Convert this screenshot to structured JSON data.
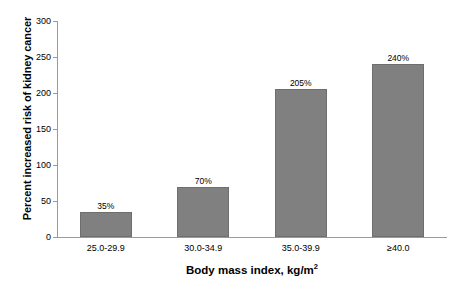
{
  "chart_data": {
    "type": "bar",
    "title": "",
    "subtitle": "",
    "xlabel": "Body mass index, kg/m",
    "xlabel_superscript": "2",
    "ylabel": "Percent increased risk of kidney cancer",
    "categories": [
      "25.0-29.9",
      "30.0-34.9",
      "35.0-39.9",
      "≥40.0"
    ],
    "values": [
      35,
      70,
      205,
      240
    ],
    "data_labels": [
      "35%",
      "70%",
      "205%",
      "240%"
    ],
    "ylim": [
      0,
      300
    ],
    "yticks": [
      0,
      50,
      100,
      150,
      200,
      250,
      300
    ],
    "ytick_labels": [
      "0",
      "50",
      "100",
      "150",
      "200",
      "250",
      "300"
    ],
    "grid": false,
    "legend": false,
    "legend_position": "none",
    "bar_color": "#808080",
    "bar_border_color": "#6e6e6e",
    "axis_color": "#9a9a9a",
    "text_color": "#000000",
    "background": "#ffffff",
    "series": [
      {
        "name": "Percent increased risk of kidney cancer",
        "values": [
          35,
          70,
          205,
          240
        ]
      }
    ]
  }
}
